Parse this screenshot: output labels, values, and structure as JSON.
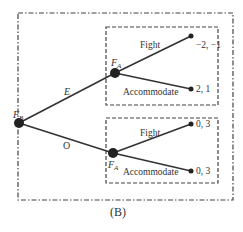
{
  "caption": "(B)",
  "nodes": {
    "root": {
      "label": "F",
      "sub": "B"
    },
    "upper": {
      "label": "F",
      "sub": "A"
    },
    "lower": {
      "label": "F",
      "sub": "A"
    }
  },
  "branches": {
    "root_upper": "E",
    "root_lower": "O",
    "upper_fight": "Fight",
    "upper_accommodate": "Accommodate",
    "lower_fight": "Fight",
    "lower_accommodate": "Accommodate"
  },
  "payoffs": {
    "upper_fight": "−2, −1",
    "upper_accommodate": "2, 1",
    "lower_fight": "0, 3",
    "lower_accommodate": "0, 3"
  },
  "colors": {
    "line": "#333333",
    "box": "#444444"
  }
}
